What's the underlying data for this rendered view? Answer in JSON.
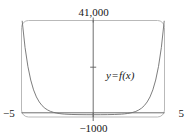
{
  "chart_data": {
    "type": "line",
    "title": "",
    "subtitle": "",
    "xlabel": "",
    "ylabel": "",
    "xlim": [
      -5,
      5
    ],
    "ylim": [
      -1000,
      41000
    ],
    "grid": false,
    "legend_position": "inside-right",
    "annotations": [
      {
        "text_y": "y",
        "text_eq": "=",
        "text_f": "f(x)",
        "x": 2.3,
        "y": 14000
      }
    ],
    "tick_labels": {
      "x_left": "−5",
      "x_right": "5",
      "y_top": "41,000",
      "y_bottom": "−1000"
    },
    "axes_style": {
      "x_axis_at_y": 0,
      "y_axis_at_x": 0,
      "frame": "rounded-rectangle",
      "y_axis_tick_at": 20000
    },
    "series": [
      {
        "name": "y = f(x)",
        "color": "#6e6e6e",
        "description": "even, U-shaped exponential-type curve symmetric about the y-axis; near zero across the middle of the window and rising steeply to about 41,000 at both x = -5 and x = 5",
        "x": [
          -5.0,
          -4.8,
          -4.6,
          -4.4,
          -4.2,
          -4.0,
          -3.8,
          -3.6,
          -3.4,
          -3.2,
          -3.0,
          -2.8,
          -2.6,
          -2.4,
          -2.2,
          -2.0,
          -1.5,
          -1.0,
          -0.5,
          0.0,
          0.5,
          1.0,
          1.5,
          2.0,
          2.2,
          2.4,
          2.6,
          2.8,
          3.0,
          3.2,
          3.4,
          3.6,
          3.8,
          4.0,
          4.2,
          4.4,
          4.6,
          4.8,
          5.0
        ],
        "y": [
          41000,
          29500,
          21200,
          15200,
          10900,
          7800,
          5600,
          4000,
          2850,
          2040,
          1450,
          1040,
          740,
          520,
          370,
          260,
          105,
          42,
          18,
          10,
          18,
          42,
          105,
          260,
          370,
          520,
          740,
          1040,
          1450,
          2040,
          2850,
          4000,
          5600,
          7800,
          10900,
          15200,
          21200,
          29500,
          41000
        ]
      }
    ]
  },
  "figure": {
    "curve_color": "#6e6e6e",
    "axis_color": "#5d5d5d",
    "frame_color": "#b9b9b9",
    "background": "#ffffff"
  }
}
